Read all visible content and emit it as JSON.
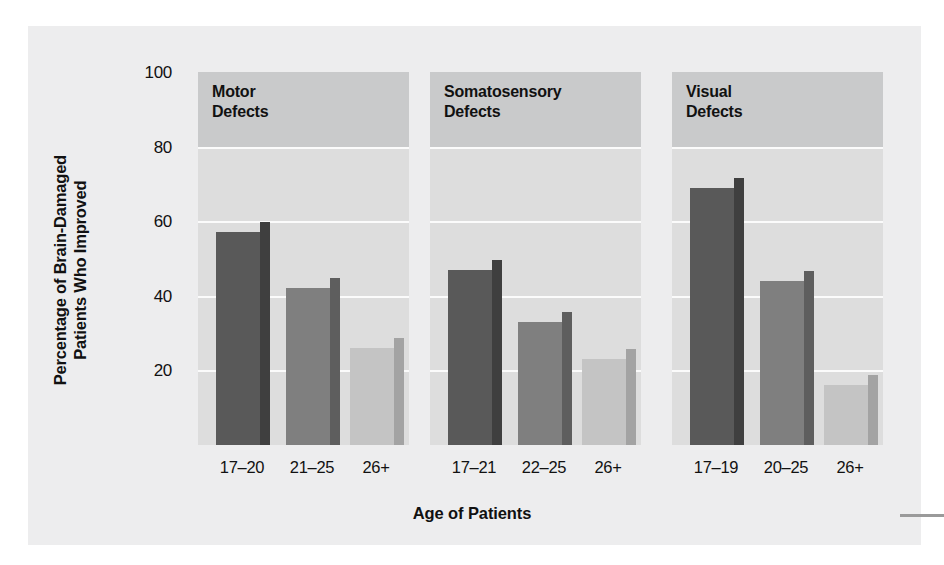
{
  "chart_data": {
    "type": "bar",
    "title": "",
    "xlabel": "Age of Patients",
    "ylabel": "Percentage of Brain-Damaged Patients Who Improved",
    "ylabel_line1": "Percentage of Brain-Damaged",
    "ylabel_line2": "Patients Who Improved",
    "ylim": [
      0,
      100
    ],
    "yticks": [
      100,
      80,
      60,
      40,
      20
    ],
    "ytick_labels": [
      "100",
      "80",
      "60",
      "40",
      "20"
    ],
    "grid": true,
    "legend": "none",
    "panels": [
      {
        "title": "Motor\nDefects",
        "title_line1": "Motor",
        "title_line2": "Defects",
        "categories": [
          "17–20",
          "21–25",
          "26+"
        ],
        "values": [
          57,
          42,
          26
        ]
      },
      {
        "title": "Somatosensory\nDefects",
        "title_line1": "Somatosensory",
        "title_line2": "Defects",
        "categories": [
          "17–21",
          "22–25",
          "26+"
        ],
        "values": [
          47,
          33,
          23
        ]
      },
      {
        "title": "Visual\nDefects",
        "title_line1": "Visual",
        "title_line2": "Defects",
        "categories": [
          "17–19",
          "20–25",
          "26+"
        ],
        "values": [
          69,
          44,
          16
        ]
      }
    ],
    "bar_colors": [
      "#595959",
      "#7f7f7f",
      "#c4c4c4"
    ],
    "bar_side_colors": [
      "#3f3f3f",
      "#5e5e5e",
      "#a3a3a3"
    ],
    "panel_bg": "#dddddd",
    "panel_band_top_bg": "#c9cacb",
    "gridline_color": "#fbfbfb",
    "figure_bg": "#ededee"
  }
}
